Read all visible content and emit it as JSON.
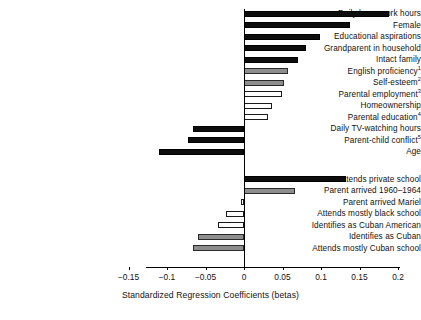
{
  "chart_data": {
    "type": "bar",
    "orientation": "horizontal",
    "title": "",
    "xlabel": "Standardized Regression Coefficients (betas)",
    "ylabel": "",
    "xlim": [
      -0.175,
      0.205
    ],
    "grid": false,
    "legend": null,
    "xticks": [
      -0.15,
      -0.1,
      -0.05,
      0,
      0.05,
      0.1,
      0.15,
      0.2
    ],
    "xticklabels": [
      "−0.15",
      "−0.1",
      "−0.05",
      "0",
      "0.05",
      "0.1",
      "0.15",
      "0.2"
    ],
    "groups": [
      {
        "name": "group-1",
        "bars": [
          {
            "label": "Daily homework hours",
            "footnote": "",
            "value": 0.188,
            "style": "black"
          },
          {
            "label": "Female",
            "footnote": "",
            "value": 0.138,
            "style": "black"
          },
          {
            "label": "Educational aspirations",
            "footnote": "",
            "value": 0.099,
            "style": "black"
          },
          {
            "label": "Grandparent in household",
            "footnote": "",
            "value": 0.081,
            "style": "black"
          },
          {
            "label": "Intact family",
            "footnote": "",
            "value": 0.07,
            "style": "black"
          },
          {
            "label": "English proficiency",
            "footnote": "1",
            "value": 0.057,
            "style": "gray"
          },
          {
            "label": "Self-esteem",
            "footnote": "2",
            "value": 0.052,
            "style": "gray"
          },
          {
            "label": "Parental employment",
            "footnote": "3",
            "value": 0.049,
            "style": "white"
          },
          {
            "label": "Homeownership",
            "footnote": "",
            "value": 0.036,
            "style": "white"
          },
          {
            "label": "Parental education",
            "footnote": "4",
            "value": 0.031,
            "style": "white"
          },
          {
            "label": "Daily TV-watching hours",
            "footnote": "",
            "value": -0.066,
            "style": "black"
          },
          {
            "label": "Parent-child conflict",
            "footnote": "5",
            "value": -0.073,
            "style": "black"
          },
          {
            "label": "Age",
            "footnote": "",
            "value": -0.11,
            "style": "black"
          }
        ]
      },
      {
        "name": "group-2",
        "bars": [
          {
            "label": "Attends private school",
            "footnote": "",
            "value": 0.133,
            "style": "black"
          },
          {
            "label": "Parent arrived 1960–1964",
            "footnote": "",
            "value": 0.066,
            "style": "gray"
          },
          {
            "label": "Parent arrived Mariel",
            "footnote": "",
            "value": -0.004,
            "style": "white"
          },
          {
            "label": "Attends mostly black school",
            "footnote": "",
            "value": -0.023,
            "style": "white"
          },
          {
            "label": "Identifies as Cuban American",
            "footnote": "",
            "value": -0.034,
            "style": "white"
          },
          {
            "label": "Identifies as Cuban",
            "footnote": "",
            "value": -0.06,
            "style": "gray"
          },
          {
            "label": "Attends mostly Cuban school",
            "footnote": "",
            "value": -0.066,
            "style": "gray"
          }
        ]
      }
    ]
  }
}
